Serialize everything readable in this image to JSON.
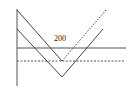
{
  "diagram": {
    "type": "payoff-diagram",
    "label": "200",
    "colors": {
      "line": "#444444",
      "axis": "#555555"
    },
    "elements": [
      {
        "name": "vertical-axis",
        "style": "solid"
      },
      {
        "name": "upper-v-left-leg",
        "style": "solid"
      },
      {
        "name": "upper-v-right-leg",
        "style": "dotted"
      },
      {
        "name": "lower-v",
        "style": "solid"
      },
      {
        "name": "horizontal-line",
        "style": "solid"
      },
      {
        "name": "horizontal-reference-line",
        "style": "dashed"
      }
    ]
  }
}
